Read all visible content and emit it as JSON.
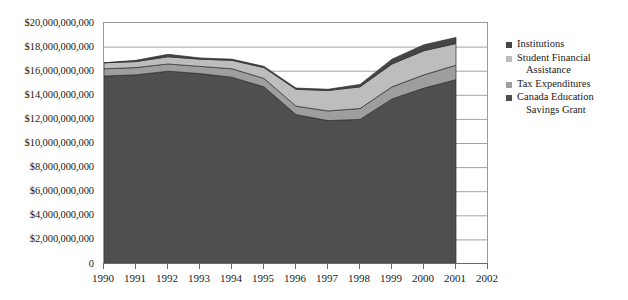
{
  "chart_data": {
    "type": "area",
    "stacked": true,
    "title": "",
    "subtitle": "",
    "xlabel": "",
    "ylabel": "",
    "grid": true,
    "legend_position": "right",
    "x": [
      1990,
      1991,
      1992,
      1993,
      1994,
      1995,
      1996,
      1997,
      1998,
      1999,
      2000,
      2001
    ],
    "xlim": [
      1990,
      2002
    ],
    "ylim": [
      0,
      20000000000
    ],
    "x_tick_labels": [
      "1990",
      "1991",
      "1992",
      "1993",
      "1994",
      "1995",
      "1996",
      "1997",
      "1998",
      "1999",
      "2000",
      "2001",
      "2002"
    ],
    "y_tick_labels": [
      "$20,000,000,000",
      "$18,000,000,000",
      "$16,000,000,000",
      "$14,000,000,000",
      "$12,000,000,000",
      "$10,000,000,000",
      "$8,000,000,000",
      "$6,000,000,000",
      "$4,000,000,000",
      "$2,000,000,000",
      "0"
    ],
    "y_tick_values": [
      20000000000,
      18000000000,
      16000000000,
      14000000000,
      12000000000,
      10000000000,
      8000000000,
      6000000000,
      4000000000,
      2000000000,
      0
    ],
    "stack_order_bottom_to_top": [
      "Canada Education Savings Grant",
      "Tax Expenditures",
      "Student Financial Assistance",
      "Institutions"
    ],
    "series": [
      {
        "name": "Canada Education Savings Grant",
        "color": "#4f4f4f",
        "values": [
          15600000000,
          15700000000,
          16000000000,
          15800000000,
          15500000000,
          14700000000,
          12400000000,
          11900000000,
          12000000000,
          13700000000,
          14600000000,
          15300000000
        ]
      },
      {
        "name": "Tax Expenditures",
        "color": "#9e9e9e",
        "values": [
          600000000,
          600000000,
          600000000,
          600000000,
          700000000,
          700000000,
          700000000,
          800000000,
          900000000,
          1000000000,
          1100000000,
          1200000000
        ]
      },
      {
        "name": "Student Financial Assistance",
        "color": "#bdbdbd",
        "values": [
          500000000,
          500000000,
          600000000,
          600000000,
          700000000,
          900000000,
          1400000000,
          1700000000,
          1800000000,
          1900000000,
          2000000000,
          1800000000
        ]
      },
      {
        "name": "Institutions",
        "color": "#454545",
        "values": [
          0,
          100000000,
          200000000,
          100000000,
          100000000,
          100000000,
          100000000,
          100000000,
          200000000,
          400000000,
          500000000,
          500000000
        ]
      }
    ],
    "totals": [
      16700000000,
      16900000000,
      17400000000,
      17100000000,
      17000000000,
      16400000000,
      14600000000,
      14500000000,
      14900000000,
      17000000000,
      18200000000,
      18800000000
    ]
  },
  "legend": {
    "items": [
      {
        "label": "Institutions",
        "label_line2": "",
        "color": "#454545"
      },
      {
        "label": "Student Financial",
        "label_line2": "Assistance",
        "color": "#bdbdbd"
      },
      {
        "label": "Tax Expenditures",
        "label_line2": "",
        "color": "#9e9e9e"
      },
      {
        "label": "Canada Education",
        "label_line2": "Savings Grant",
        "color": "#4f4f4f"
      }
    ]
  },
  "colors": {
    "background": "#ffffff",
    "gridline": "#8c8c8c",
    "axis": "#6b6b6b",
    "text": "#1a1a1a"
  }
}
